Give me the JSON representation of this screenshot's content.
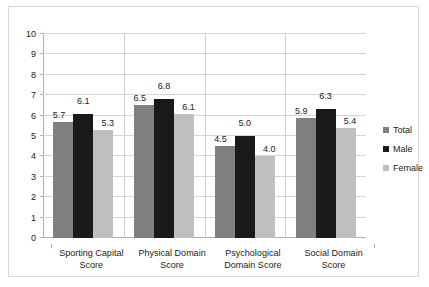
{
  "chart_data": {
    "type": "bar",
    "title": "",
    "xlabel": "",
    "ylabel": "",
    "ylim": [
      0,
      10
    ],
    "ytick_step": 1,
    "yticks": [
      "0",
      "1",
      "2",
      "3",
      "4",
      "5",
      "6",
      "7",
      "8",
      "9",
      "10"
    ],
    "grid": true,
    "legend_position": "right",
    "categories": [
      "Sporting Capital Score",
      "Physical Domain Score",
      "Psychological Domain Score",
      "Social Domain Score"
    ],
    "series": [
      {
        "name": "Total",
        "color": "#808080",
        "values": [
          5.7,
          6.5,
          4.5,
          5.9
        ],
        "labels": [
          "5.7",
          "6.5",
          "4.5",
          "5.9"
        ]
      },
      {
        "name": "Male",
        "color": "#1a1a1a",
        "values": [
          6.1,
          6.8,
          5.0,
          6.3
        ],
        "labels": [
          "6.1",
          "6.8",
          "5.0",
          "6.3"
        ]
      },
      {
        "name": "Female",
        "color": "#bfbfbf",
        "values": [
          5.3,
          6.1,
          4.0,
          5.4
        ],
        "labels": [
          "5.3",
          "6.1",
          "4.0",
          "5.4"
        ]
      }
    ]
  },
  "legend": {
    "items": [
      {
        "label": "Total"
      },
      {
        "label": "Male"
      },
      {
        "label": "Female"
      }
    ]
  }
}
